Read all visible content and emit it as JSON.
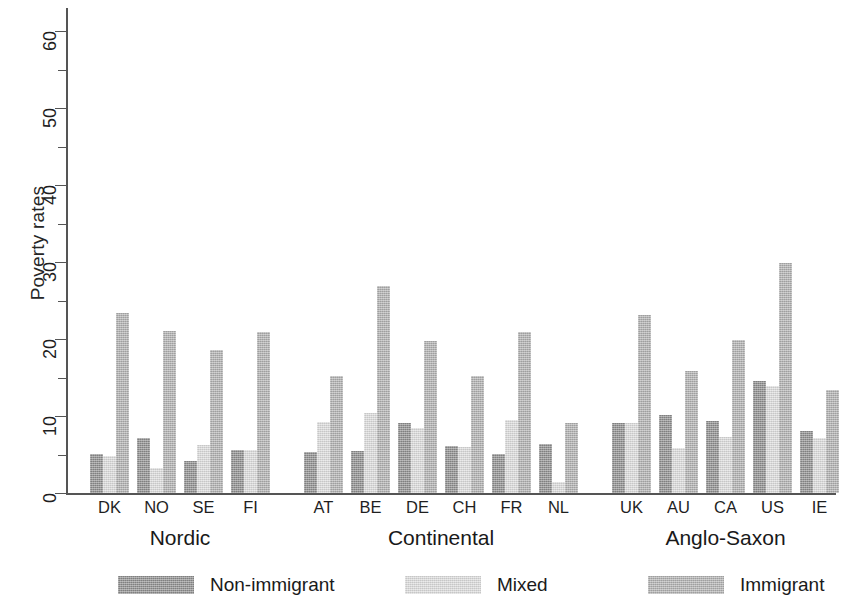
{
  "chart_data": {
    "type": "bar",
    "title": "",
    "xlabel": "",
    "ylabel": "Poverty rates",
    "ylim": [
      0,
      63
    ],
    "yticks": [
      0,
      10,
      20,
      30,
      40,
      50,
      60
    ],
    "ytick_labels": [
      "0",
      "10",
      "20",
      "30",
      "40",
      "50",
      "60"
    ],
    "minor_ticks": [
      5,
      15,
      25,
      35,
      45,
      55
    ],
    "grid": false,
    "legend_position": "bottom",
    "categories": [
      "DK",
      "NO",
      "SE",
      "FI",
      "AT",
      "BE",
      "DE",
      "CH",
      "FR",
      "NL",
      "UK",
      "AU",
      "CA",
      "US",
      "IE",
      "ES",
      "GR",
      "IT",
      "PT"
    ],
    "groups": [
      {
        "label": "Nordic",
        "categories": [
          "DK",
          "NO",
          "SE",
          "FI"
        ]
      },
      {
        "label": "Continental",
        "categories": [
          "AT",
          "BE",
          "DE",
          "CH",
          "FR",
          "NL"
        ]
      },
      {
        "label": "Anglo-Saxon",
        "categories": [
          "UK",
          "AU",
          "CA",
          "US",
          "IE"
        ]
      },
      {
        "label": "Southern",
        "categories": [
          "ES",
          "GR",
          "IT",
          "PT"
        ]
      }
    ],
    "series": [
      {
        "name": "Non-immigrant",
        "color": "#8f8f8f",
        "values": [
          5.1,
          7.2,
          4.2,
          5.6,
          5.3,
          5.5,
          9.1,
          6.1,
          5.1,
          6.4,
          9.1,
          10.1,
          9.3,
          14.6,
          8.1,
          12.5,
          12.2,
          12.3,
          12.0
        ]
      },
      {
        "name": "Mixed",
        "color": "#dedede",
        "values": [
          4.8,
          3.2,
          6.2,
          5.6,
          9.2,
          10.4,
          8.4,
          6.0,
          9.5,
          1.4,
          9.1,
          5.9,
          7.3,
          13.9,
          7.2,
          14.8,
          14.4,
          10.9,
          10.6
        ]
      },
      {
        "name": "Immigrant",
        "color": "#b2b2b2",
        "values": [
          23.4,
          21.1,
          18.6,
          20.9,
          15.2,
          26.9,
          19.7,
          15.2,
          20.9,
          9.1,
          23.1,
          15.8,
          19.9,
          29.9,
          13.4,
          26.0,
          23.9,
          23.8,
          21.4
        ]
      }
    ]
  },
  "legend": {
    "items": [
      {
        "label": "Non-immigrant",
        "color": "#8f8f8f"
      },
      {
        "label": "Mixed",
        "color": "#dedede"
      },
      {
        "label": "Immigrant",
        "color": "#b2b2b2"
      }
    ]
  }
}
